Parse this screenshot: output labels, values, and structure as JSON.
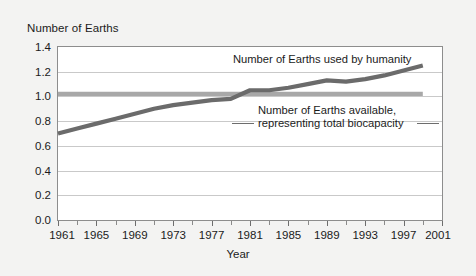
{
  "chart_data": {
    "type": "line",
    "title": "",
    "ylabel": "Number of Earths",
    "xlabel": "Year",
    "ylim": [
      0.0,
      1.4
    ],
    "xlim": [
      1961,
      2001
    ],
    "grid": true,
    "legend_position": "inline-annotation",
    "ytick_labels": [
      "0.0",
      "0.2",
      "0.4",
      "0.6",
      "0.8",
      "1.0",
      "1.2",
      "1.4"
    ],
    "ytick_values": [
      0.0,
      0.2,
      0.4,
      0.6,
      0.8,
      1.0,
      1.2,
      1.4
    ],
    "xtick_labels": [
      "1961",
      "1965",
      "1969",
      "1973",
      "1977",
      "1981",
      "1985",
      "1989",
      "1993",
      "1997",
      "2001"
    ],
    "xtick_values": [
      1961,
      1965,
      1969,
      1973,
      1977,
      1981,
      1985,
      1989,
      1993,
      1997,
      2001
    ],
    "xtick_minor_values": [
      1963,
      1967,
      1971,
      1975,
      1979,
      1983,
      1987,
      1991,
      1995,
      1999
    ],
    "x": [
      1961,
      1963,
      1965,
      1967,
      1969,
      1971,
      1973,
      1975,
      1977,
      1979,
      1981,
      1983,
      1985,
      1987,
      1989,
      1991,
      1993,
      1995,
      1997,
      1999
    ],
    "series": [
      {
        "name": "Number of Earths used by humanity",
        "color": "#6b6b6b",
        "values": [
          0.7,
          0.74,
          0.78,
          0.82,
          0.86,
          0.9,
          0.93,
          0.95,
          0.97,
          0.98,
          1.05,
          1.05,
          1.07,
          1.1,
          1.13,
          1.12,
          1.14,
          1.17,
          1.21,
          1.25
        ]
      },
      {
        "name": "Number of Earths available, representing total biocapacity",
        "color": "#a8a8a8",
        "values": [
          1.02,
          1.02,
          1.02,
          1.02,
          1.02,
          1.02,
          1.02,
          1.02,
          1.02,
          1.02,
          1.02,
          1.02,
          1.02,
          1.02,
          1.02,
          1.02,
          1.02,
          1.02,
          1.02,
          1.02
        ]
      }
    ],
    "annotations": [
      {
        "text": "Number of Earths used by humanity"
      },
      {
        "text_line1": "Number of Earths available,",
        "text_line2": "representing total biocapacity"
      }
    ]
  },
  "labels": {
    "y_axis_title": "Number of Earths",
    "x_axis_title": "Year",
    "footprint_label": "Number of Earths used by humanity",
    "biocapacity_label_line1": "Number of Earths available,",
    "biocapacity_label_line2": "representing total biocapacity"
  },
  "colors": {
    "background": "#f3f3f2",
    "plot_background": "#ffffff",
    "frame": "#8d8d8d",
    "grid": "#c9c9c9",
    "footprint_line": "#6b6b6b",
    "biocapacity_line": "#a8a8a8",
    "text": "#1b1b1b"
  }
}
